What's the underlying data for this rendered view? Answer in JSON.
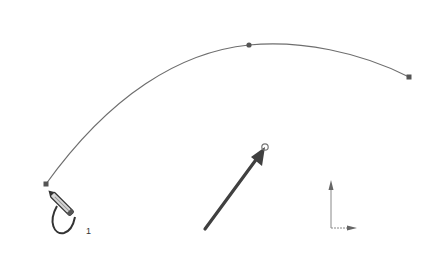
{
  "canvas": {
    "background": "#ffffff",
    "line_color": "#6e6e6e",
    "point_color": "#555555",
    "arrow_color": "#404040"
  },
  "spline": {
    "start_point": [
      46,
      184
    ],
    "mid_point": [
      249,
      45
    ],
    "end_point": [
      409,
      77
    ]
  },
  "cursor": {
    "icon": "pencil-spline-icon",
    "counter_label": "1"
  },
  "direction_arrow": {
    "from": [
      205,
      229
    ],
    "to": [
      265,
      147
    ]
  },
  "origin_axes": {
    "icon": "origin-axes-icon"
  }
}
